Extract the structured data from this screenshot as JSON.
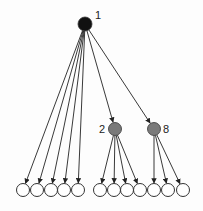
{
  "diagram": {
    "type": "tree",
    "colors": {
      "root": "#111111",
      "internal": "#7a7a7a",
      "leaf": "#ffffff",
      "edge": "#222222",
      "stroke": "#333333"
    },
    "nodes": [
      {
        "id": "root",
        "label": "1",
        "kind": "root"
      },
      {
        "id": "n2",
        "label": "2",
        "kind": "internal"
      },
      {
        "id": "n8",
        "label": "8",
        "kind": "internal"
      },
      {
        "id": "leaf1",
        "label": "",
        "kind": "leaf"
      },
      {
        "id": "leaf2",
        "label": "",
        "kind": "leaf"
      },
      {
        "id": "leaf3",
        "label": "",
        "kind": "leaf"
      },
      {
        "id": "leaf4",
        "label": "",
        "kind": "leaf"
      },
      {
        "id": "leaf5",
        "label": "",
        "kind": "leaf"
      },
      {
        "id": "leaf6",
        "label": "",
        "kind": "leaf"
      },
      {
        "id": "leaf7",
        "label": "",
        "kind": "leaf"
      },
      {
        "id": "leaf8",
        "label": "",
        "kind": "leaf"
      },
      {
        "id": "leaf9",
        "label": "",
        "kind": "leaf"
      },
      {
        "id": "leaf10",
        "label": "",
        "kind": "leaf"
      },
      {
        "id": "leaf11",
        "label": "",
        "kind": "leaf"
      },
      {
        "id": "leaf12",
        "label": "",
        "kind": "leaf"
      }
    ],
    "edges": [
      {
        "from": "root",
        "to": "leaf1"
      },
      {
        "from": "root",
        "to": "leaf2"
      },
      {
        "from": "root",
        "to": "leaf3"
      },
      {
        "from": "root",
        "to": "leaf4"
      },
      {
        "from": "root",
        "to": "leaf5"
      },
      {
        "from": "root",
        "to": "n2"
      },
      {
        "from": "root",
        "to": "n8"
      },
      {
        "from": "n2",
        "to": "leaf6"
      },
      {
        "from": "n2",
        "to": "leaf7"
      },
      {
        "from": "n2",
        "to": "leaf8"
      },
      {
        "from": "n2",
        "to": "leaf9"
      },
      {
        "from": "n8",
        "to": "leaf10"
      },
      {
        "from": "n8",
        "to": "leaf11"
      },
      {
        "from": "n8",
        "to": "leaf12"
      }
    ]
  }
}
